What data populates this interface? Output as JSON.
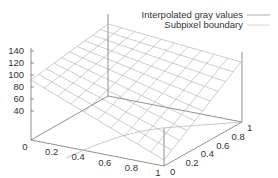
{
  "chart_data": {
    "type": "surface3d",
    "title": "",
    "xlabel": "",
    "ylabel": "",
    "zlabel": "",
    "x_ticks": [
      "0",
      "0.2",
      "0.4",
      "0.6",
      "0.8",
      "1"
    ],
    "y_ticks": [
      "0",
      "0.2",
      "0.4",
      "0.6",
      "0.8",
      "1"
    ],
    "z_ticks": [
      "40",
      "60",
      "80",
      "100",
      "120",
      "140"
    ],
    "xlim": [
      0,
      1
    ],
    "ylim": [
      0,
      1
    ],
    "zlim": [
      20,
      140
    ],
    "grid_divisions": 10,
    "legend": [
      {
        "label": "Interpolated gray values",
        "color": "#aaaaaa"
      },
      {
        "label": "Subpixel boundary",
        "color": "#cccccc"
      }
    ],
    "legend_position": "top-right",
    "series": [
      {
        "name": "Interpolated gray values",
        "kind": "plane",
        "corners": [
          {
            "x": 0,
            "y": 0,
            "z": 120
          },
          {
            "x": 1,
            "y": 0,
            "z": 30
          },
          {
            "x": 1,
            "y": 1,
            "z": 120
          },
          {
            "x": 0,
            "y": 1,
            "z": 140
          }
        ]
      },
      {
        "name": "Subpixel boundary",
        "kind": "curve-on-base",
        "points": [
          {
            "x": 0.2,
            "y": 0
          },
          {
            "x": 0.6,
            "y": 0.3
          },
          {
            "x": 1,
            "y": 0.6
          }
        ]
      }
    ]
  },
  "axes": {
    "z_labels": [
      "140",
      "120",
      "100",
      "80",
      "60",
      "40"
    ],
    "x_labels": [
      "0",
      "0.2",
      "0.4",
      "0.6",
      "0.8",
      "1"
    ],
    "y_labels": [
      "0",
      "0.2",
      "0.4",
      "0.6",
      "0.8",
      "1"
    ]
  },
  "legend": {
    "items": [
      "Interpolated gray values",
      "Subpixel boundary"
    ]
  }
}
